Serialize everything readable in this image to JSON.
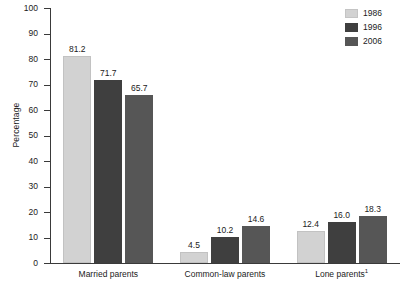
{
  "chart_data": {
    "type": "bar",
    "title": "",
    "xlabel": "",
    "ylabel": "Percentage",
    "ylim": [
      0,
      100
    ],
    "ytick_labels": [
      "0",
      "10",
      "20",
      "30",
      "40",
      "50",
      "60",
      "70",
      "80",
      "90",
      "100"
    ],
    "yticks": [
      0,
      10,
      20,
      30,
      40,
      50,
      60,
      70,
      80,
      90,
      100
    ],
    "grid": false,
    "legend_position": "top-right",
    "categories": [
      "Married parents",
      "Common-law parents",
      "Lone parents"
    ],
    "category_footnote_marks": [
      "",
      "",
      "1"
    ],
    "series": [
      {
        "name": "1986",
        "color": "#d2d2d2",
        "values": [
          81.2,
          4.5,
          12.4
        ]
      },
      {
        "name": "1996",
        "color": "#3f3f3f",
        "values": [
          71.7,
          10.2,
          16.0
        ]
      },
      {
        "name": "2006",
        "color": "#565656",
        "values": [
          65.7,
          14.6,
          18.3
        ]
      }
    ],
    "value_labels": [
      [
        "81.2",
        "4.5",
        "12.4"
      ],
      [
        "71.7",
        "10.2",
        "16.0"
      ],
      [
        "65.7",
        "14.6",
        "18.3"
      ]
    ]
  },
  "legend": {
    "items": [
      {
        "label": "1986"
      },
      {
        "label": "1996"
      },
      {
        "label": "2006"
      }
    ]
  },
  "axis": {
    "y_title": "Percentage"
  }
}
